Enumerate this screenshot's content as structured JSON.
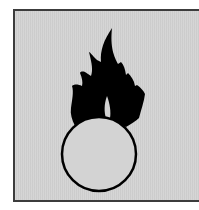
{
  "pictogram": {
    "name": "flame-over-circle",
    "background_color": "#d3d3d3",
    "border_color": "#3c3c3c",
    "symbol_color": "#000000"
  }
}
